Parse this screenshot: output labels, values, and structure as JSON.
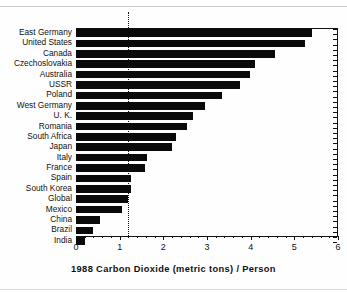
{
  "chart_data": {
    "type": "bar",
    "orientation": "horizontal",
    "title": "1988 Carbon Dioxide (metric tons) / Person",
    "xlabel": "1988 Carbon Dioxide (metric tons) / Person",
    "ylabel": "",
    "xlim": [
      0,
      6
    ],
    "xticks": [
      0,
      1,
      2,
      3,
      4,
      5,
      6
    ],
    "xtick_labels": [
      "0",
      "1",
      "2",
      "3",
      "4",
      "5",
      "6"
    ],
    "grid": false,
    "legend": null,
    "reference_line": {
      "label": "Global",
      "value": 1.2,
      "style": "dotted"
    },
    "bar_color": "#0a0a0a",
    "categories": [
      "East Germany",
      "United States",
      "Canada",
      "Czechoslovakia",
      "Australia",
      "USSR",
      "Poland",
      "West Germany",
      "U. K.",
      "Romania",
      "South Africa",
      "Japan",
      "Italy",
      "France",
      "Spain",
      "South Korea",
      "Global",
      "Mexico",
      "China",
      "Brazil",
      "India"
    ],
    "values": [
      5.4,
      5.25,
      4.55,
      4.1,
      3.98,
      3.75,
      3.35,
      2.95,
      2.68,
      2.55,
      2.28,
      2.2,
      1.62,
      1.58,
      1.27,
      1.26,
      1.2,
      1.05,
      0.55,
      0.4,
      0.2
    ]
  }
}
